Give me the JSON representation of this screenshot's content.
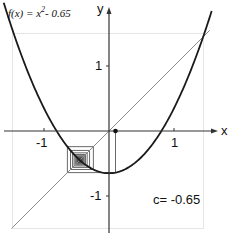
{
  "chart_data": {
    "type": "line",
    "title": "",
    "function_label": "f(x) = x^2 - 0.65",
    "function_parts": {
      "prefix": "f(x) = x",
      "exponent": "2",
      "suffix": "- 0.65"
    },
    "parameter_label": "c= -0.65",
    "xlabel": "x",
    "ylabel": "y",
    "x_ticks": [
      "-1",
      "1"
    ],
    "y_ticks": [
      "1",
      "-1"
    ],
    "xlim": [
      -1.5,
      1.5
    ],
    "ylim": [
      -1.5,
      1.5
    ],
    "grid": false,
    "series": [
      {
        "name": "f(x) = x^2 - 0.65",
        "kind": "parabola",
        "c": -0.65,
        "color": "#1a1a1a"
      },
      {
        "name": "y = x",
        "kind": "diagonal",
        "color": "#888888"
      },
      {
        "name": "cobweb orbit",
        "kind": "cobweb",
        "x0": 0.1,
        "iterations": 40,
        "fixed_point": -0.4487,
        "color": "#444444"
      }
    ],
    "start_point": {
      "x": 0.1,
      "y": 0
    }
  },
  "colors": {
    "curve": "#1a1a1a",
    "diagonal": "#8a8a8a",
    "frame": "#e6e6e6",
    "axis": "#333333"
  }
}
